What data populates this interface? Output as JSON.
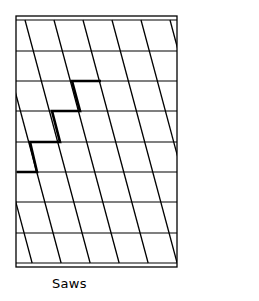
{
  "caption": "Saws",
  "pattern": {
    "name": "saws",
    "frame": {
      "left": 16,
      "right": 177,
      "top": 16,
      "bottom": 267
    },
    "inner_top": 20,
    "inner_bottom": 263,
    "row_lines_y": [
      20,
      51,
      81,
      111,
      142,
      172,
      202,
      233,
      263
    ],
    "slant": {
      "x0_at_y20": [
        -91,
        -62,
        -33,
        -4,
        25,
        54,
        83,
        112,
        141,
        170
      ],
      "dx_per_px": 0.268
    },
    "highlight_path": [
      [
        101,
        81
      ],
      [
        72,
        81
      ],
      [
        80,
        111
      ],
      [
        52,
        111
      ],
      [
        60,
        142
      ],
      [
        30,
        142
      ],
      [
        37,
        172
      ],
      [
        17,
        172
      ]
    ],
    "stroke_color": "#000000",
    "background_color": "#ffffff"
  }
}
